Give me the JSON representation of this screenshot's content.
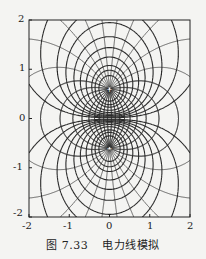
{
  "caption": {
    "figure_number": "图 7.33",
    "title": "电力线模拟"
  },
  "colors": {
    "background": "#f4f4f2",
    "line": "#2a2a2a",
    "frame": "#222222"
  },
  "chart_data": {
    "type": "line",
    "title": "电力线模拟",
    "xlabel": "",
    "ylabel": "",
    "xlim": [
      -2,
      2
    ],
    "ylim": [
      -2,
      2
    ],
    "xticks": [
      -2,
      -1,
      0,
      1,
      2
    ],
    "yticks": [
      -2,
      -1,
      0,
      1,
      2
    ],
    "grid": false,
    "charges": [
      {
        "x": 0,
        "y": 0.6,
        "q": 1
      },
      {
        "x": 0,
        "y": -0.6,
        "q": -1
      }
    ],
    "field_lines_per_charge": 28,
    "equipotential_levels": [
      -3,
      -2,
      -1.5,
      -1,
      -0.7,
      -0.5,
      -0.35,
      -0.25,
      -0.15,
      -0.08,
      0.08,
      0.15,
      0.25,
      0.35,
      0.5,
      0.7,
      1,
      1.5,
      2,
      3
    ]
  },
  "plot_box": {
    "left": 29,
    "top": 20,
    "right": 190,
    "bottom": 217
  }
}
